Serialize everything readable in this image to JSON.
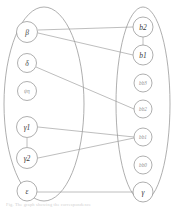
{
  "figure": {
    "type": "bipartite-graph",
    "background_color": "#ffffff",
    "stroke_color": "#9a9a9a",
    "label_color": "#3a3a3a",
    "caption": "Fig. The graph showing the correspondence"
  },
  "groups": [
    {
      "id": "left-group",
      "name": "left-ellipse",
      "cx": 44,
      "cy": 104,
      "rx": 40,
      "ry": 97
    },
    {
      "id": "right-group",
      "name": "right-ellipse",
      "cx": 143,
      "cy": 104,
      "rx": 27,
      "ry": 97
    }
  ],
  "nodes": {
    "left": [
      {
        "id": "beta",
        "label": "β",
        "cx": 27,
        "cy": 32,
        "r": 10.5,
        "size": "normal"
      },
      {
        "id": "delta",
        "label": "δ",
        "cx": 27,
        "cy": 63,
        "r": 9.5,
        "size": "normal"
      },
      {
        "id": "psieta",
        "label": "ψη",
        "cx": 27,
        "cy": 91,
        "r": 9.5,
        "size": "small"
      },
      {
        "id": "gamma1",
        "label": "γ1",
        "cx": 27,
        "cy": 127,
        "r": 10.5,
        "size": "normal"
      },
      {
        "id": "gamma2",
        "label": "γ2",
        "cx": 27,
        "cy": 158,
        "r": 10.5,
        "size": "normal"
      },
      {
        "id": "epsilon",
        "label": "ε",
        "cx": 27,
        "cy": 191,
        "r": 10.0,
        "size": "normal"
      }
    ],
    "right": [
      {
        "id": "b2",
        "label": "b2",
        "cx": 143,
        "cy": 27,
        "r": 10.0,
        "size": "normal"
      },
      {
        "id": "b1",
        "label": "b1",
        "cx": 143,
        "cy": 55,
        "r": 10.0,
        "size": "normal"
      },
      {
        "id": "bb3",
        "label": "bb3",
        "cx": 143,
        "cy": 83,
        "r": 9.0,
        "size": "small"
      },
      {
        "id": "bb2",
        "label": "bb2",
        "cx": 143,
        "cy": 109,
        "r": 9.0,
        "size": "small"
      },
      {
        "id": "bb1",
        "label": "bb1",
        "cx": 143,
        "cy": 137,
        "r": 9.0,
        "size": "small"
      },
      {
        "id": "bb0",
        "label": "bb0",
        "cx": 143,
        "cy": 165,
        "r": 9.0,
        "size": "small"
      },
      {
        "id": "gamma",
        "label": "γ",
        "cx": 143,
        "cy": 192,
        "r": 10.0,
        "size": "normal"
      }
    ]
  },
  "edges": [
    {
      "id": "e1",
      "from": "beta",
      "to": "b2",
      "x1": 38,
      "y1": 30,
      "x2": 133,
      "y2": 27
    },
    {
      "id": "e2",
      "from": "beta",
      "to": "b1",
      "x1": 38,
      "y1": 33,
      "x2": 133,
      "y2": 55
    },
    {
      "id": "e3",
      "from": "delta",
      "to": "bb2",
      "x1": 36,
      "y1": 67,
      "x2": 134,
      "y2": 109
    },
    {
      "id": "e4",
      "from": "gamma1",
      "to": "bb1",
      "x1": 38,
      "y1": 127,
      "x2": 134,
      "y2": 137
    },
    {
      "id": "e5",
      "from": "gamma2",
      "to": "bb1",
      "x1": 38,
      "y1": 158,
      "x2": 134,
      "y2": 138
    },
    {
      "id": "e6",
      "from": "epsilon",
      "to": "gamma",
      "x1": 37,
      "y1": 192,
      "x2": 133,
      "y2": 192
    },
    {
      "id": "e7",
      "from": "b2",
      "to": "b1",
      "x1": 143,
      "y1": 37,
      "x2": 143,
      "y2": 45
    },
    {
      "id": "e8",
      "from": "gamma1",
      "to": "gamma2",
      "x1": 27,
      "y1": 138,
      "x2": 27,
      "y2": 147
    }
  ]
}
